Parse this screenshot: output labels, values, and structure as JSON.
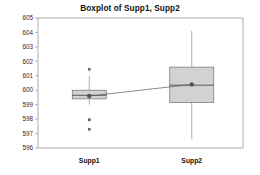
{
  "chart_data": {
    "type": "box",
    "title": "Boxplot of Supp1, Supp2",
    "xlabel": "",
    "ylabel": "",
    "categories": [
      "Supp1",
      "Supp2"
    ],
    "ylim": [
      596,
      605
    ],
    "yticks": [
      596,
      597,
      598,
      599,
      600,
      601,
      602,
      603,
      604,
      605
    ],
    "grid": false,
    "legend": "none",
    "connect_means": true,
    "series": [
      {
        "name": "Supp1",
        "q1": 599.4,
        "median": 599.65,
        "q3": 600.0,
        "whisker_low": 599.0,
        "whisker_high": 601.0,
        "mean": 599.6,
        "outliers": [
          601.45,
          597.95,
          597.3
        ]
      },
      {
        "name": "Supp2",
        "q1": 599.15,
        "median": 600.35,
        "q3": 601.6,
        "whisker_low": 596.6,
        "whisker_high": 604.1,
        "mean": 600.4,
        "outliers": []
      }
    ],
    "colors": {
      "box_fill": "#d2d2d2",
      "box_edge": "#6e6e6e",
      "median": "#4a4a4a",
      "whisker": "#8c8c8c",
      "mean_marker": "#555555",
      "outlier": "#6a6a6a",
      "frame": "#9a9a9a",
      "background": "#ffffff"
    }
  }
}
